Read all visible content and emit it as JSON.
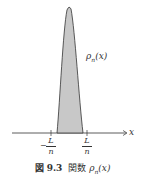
{
  "figure": {
    "curve_label": "ρn(x)",
    "curve_label_base": "ρ",
    "curve_label_sub": "n",
    "curve_label_arg": "(x)",
    "axis_label": "x",
    "tick_left": {
      "sign": "−",
      "numerator": "L",
      "denominator": "n"
    },
    "tick_right": {
      "numerator": "L",
      "denominator": "n"
    },
    "caption_number": "図 9.3",
    "caption_text": "関数",
    "caption_math": "ρn(x)",
    "caption_math_base": "ρ",
    "caption_math_sub": "n",
    "caption_math_arg": "(x)",
    "colors": {
      "fill": "#c8c8c8",
      "stroke": "#333333",
      "axis": "#333333"
    }
  }
}
